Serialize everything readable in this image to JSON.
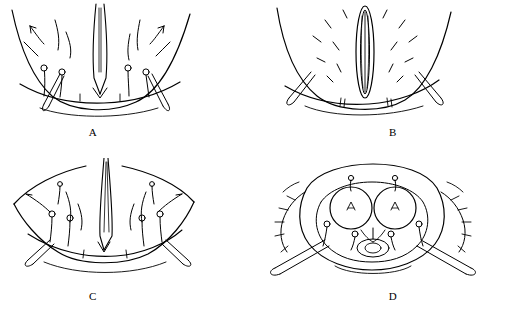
{
  "figure": {
    "kind": "line-drawing-plate",
    "background_color": "#ffffff",
    "ink_color": "#000000",
    "panels": [
      {
        "id": "a",
        "label": "A",
        "name": "panel-a",
        "features": "arched outline with central longitudinal slit, paired lateral setae and club-tipped setae"
      },
      {
        "id": "b",
        "label": "B",
        "name": "panel-b",
        "features": "arched outline with elongate oval central structure, short dashes and lateral club setae"
      },
      {
        "id": "c",
        "label": "C",
        "name": "panel-c",
        "features": "wide arch with narrow central spine, symmetric club-tipped setae pairs"
      },
      {
        "id": "d",
        "label": "D",
        "name": "panel-d",
        "features": "rounded body with two large circular discs, central oval and long lateral club setae"
      }
    ]
  }
}
